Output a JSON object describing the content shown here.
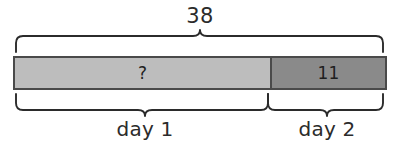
{
  "diagram": {
    "type": "part-part-whole-bar-model",
    "total": {
      "label": "38",
      "value": 38
    },
    "segments": [
      {
        "label": "?",
        "value": null,
        "caption": "day 1",
        "fill_color": "#bdbdbd",
        "fraction_of_total": 0.71
      },
      {
        "label": "11",
        "value": 11,
        "caption": "day 2",
        "fill_color": "#8a8a8a",
        "fraction_of_total": 0.29
      }
    ],
    "stroke_color": "#2b2b2b",
    "border_color": "#4a4a4a",
    "background_color": "#ffffff"
  }
}
